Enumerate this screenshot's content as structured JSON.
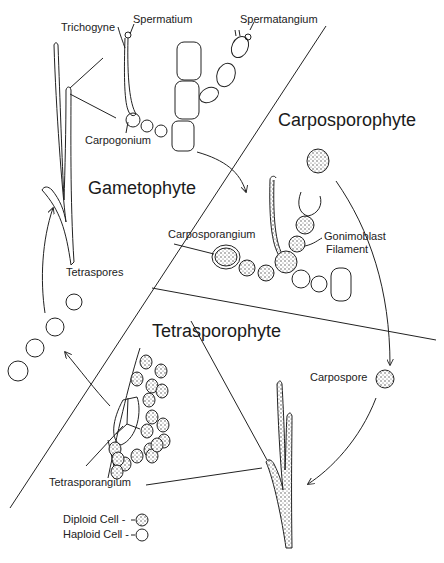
{
  "diagram": {
    "type": "life-cycle",
    "colors": {
      "stroke": "#222222",
      "background": "#ffffff",
      "stipple": "#555555"
    },
    "phases": {
      "gametophyte": "Gametophyte",
      "carposporophyte": "Carposporophyte",
      "tetrasporophyte": "Tetrasporophyte"
    },
    "labels": {
      "trichogyne": "Trichogyne",
      "spermatium": "Spermatium",
      "spermatangium": "Spermatangium",
      "carpogonium": "Carpogonium",
      "carposporangium": "Carposporangium",
      "gonimoblast_line1": "Gonimoblast",
      "gonimoblast_line2": "Filament",
      "tetraspores": "Tetraspores",
      "carpospore": "Carpospore",
      "tetrasporangium": "Tetrasporangium"
    },
    "legend": [
      {
        "label": "Diploid Cell -",
        "symbol": "stippled-circle"
      },
      {
        "label": "Haploid Cell -",
        "symbol": "open-circle"
      }
    ]
  }
}
